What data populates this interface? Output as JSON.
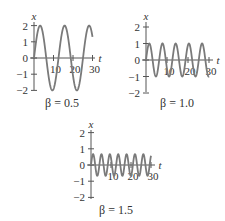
{
  "chart_data": [
    {
      "type": "line",
      "title": "β = 0.5",
      "xlabel": "t",
      "ylabel": "x",
      "xlim": [
        0,
        30
      ],
      "ylim": [
        -2,
        2
      ],
      "xticks": [
        10,
        20,
        30
      ],
      "yticks": [
        2,
        1,
        0,
        -1,
        -2
      ],
      "series": [
        {
          "name": "x(t)",
          "formula": "2 sin(0.5 t)",
          "amplitude": 2,
          "omega": 0.5
        }
      ],
      "grid": false,
      "layout": {
        "x0": 34,
        "y0": 58,
        "px_per_t": 1.95,
        "px_per_x": 16.2,
        "axis_end": 95,
        "ytop": 22,
        "ybot": 90
      }
    },
    {
      "type": "line",
      "title": "β = 1.0",
      "xlabel": "t",
      "ylabel": "x",
      "xlim": [
        0,
        30
      ],
      "ylim": [
        -2,
        2
      ],
      "xticks": [
        10,
        20,
        30
      ],
      "yticks": [
        2,
        1,
        0,
        -1,
        -2
      ],
      "series": [
        {
          "name": "x(t)",
          "formula": "sin(t)",
          "amplitude": 1,
          "omega": 1.0
        }
      ],
      "grid": false,
      "layout": {
        "x0": 146,
        "y0": 60,
        "px_per_t": 2.1,
        "px_per_x": 16.5,
        "axis_end": 213,
        "ytop": 22,
        "ybot": 92
      }
    },
    {
      "type": "line",
      "title": "β = 1.5",
      "xlabel": "t",
      "ylabel": "x",
      "xlim": [
        0,
        30
      ],
      "ylim": [
        -2,
        2
      ],
      "xticks": [
        10,
        20,
        30
      ],
      "yticks": [
        2,
        1,
        0,
        -1,
        -2
      ],
      "series": [
        {
          "name": "x(t)",
          "formula": "(2/3) sin(1.5 t)",
          "amplitude": 0.667,
          "omega": 1.5
        }
      ],
      "grid": false,
      "layout": {
        "x0": 91,
        "y0": 165,
        "px_per_t": 2.0,
        "px_per_x": 16.2,
        "axis_end": 155,
        "ytop": 130,
        "ybot": 199
      }
    }
  ],
  "panels": [
    {
      "beta_label": "β = 0.5",
      "x_axis_label": "t",
      "y_axis_label": "x"
    },
    {
      "beta_label": "β = 1.0",
      "x_axis_label": "t",
      "y_axis_label": "x"
    },
    {
      "beta_label": "β = 1.5",
      "x_axis_label": "t",
      "y_axis_label": "x"
    }
  ],
  "colors": {
    "curve": "#7a7a7a",
    "axis": "#555555",
    "text": "#333333"
  }
}
